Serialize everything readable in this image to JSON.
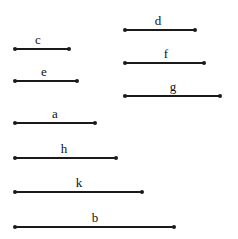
{
  "figure": {
    "type": "line-segment-length-diagram",
    "width": 238,
    "height": 239,
    "background_color": "#ffffff",
    "line_color": "#1a1a1a",
    "label_color": "#111111",
    "endpoint_marker": "filled-dot"
  },
  "chart_data": {
    "type": "bar",
    "title": "",
    "xlabel": "",
    "ylabel": "",
    "orientation": "horizontal",
    "categories": [
      "c",
      "d",
      "e",
      "f",
      "g",
      "a",
      "h",
      "k",
      "b"
    ],
    "values": [
      56,
      72,
      64,
      81,
      97,
      82,
      103,
      129,
      161
    ],
    "note": "Each value is the pixel length of the labeled horizontal segment"
  },
  "segments": [
    {
      "id": "segment-d",
      "label": "d",
      "x1": 124,
      "x2": 196,
      "y": 29,
      "length": 72,
      "label_x": 158,
      "label_y": 14
    },
    {
      "id": "segment-c",
      "label": "c",
      "x1": 14,
      "x2": 70,
      "y": 48,
      "length": 56,
      "label_x": 38,
      "label_y": 33
    },
    {
      "id": "segment-f",
      "label": "f",
      "x1": 124,
      "x2": 205,
      "y": 62,
      "length": 81,
      "label_x": 166,
      "label_y": 47
    },
    {
      "id": "segment-e",
      "label": "e",
      "x1": 14,
      "x2": 78,
      "y": 80,
      "length": 64,
      "label_x": 44,
      "label_y": 65
    },
    {
      "id": "segment-g",
      "label": "g",
      "x1": 124,
      "x2": 221,
      "y": 95,
      "length": 97,
      "label_x": 173,
      "label_y": 80
    },
    {
      "id": "segment-a",
      "label": "a",
      "x1": 14,
      "x2": 96,
      "y": 122,
      "length": 82,
      "label_x": 55,
      "label_y": 107
    },
    {
      "id": "segment-h",
      "label": "h",
      "x1": 14,
      "x2": 117,
      "y": 157,
      "length": 103,
      "label_x": 64,
      "label_y": 142
    },
    {
      "id": "segment-k",
      "label": "k",
      "x1": 14,
      "x2": 143,
      "y": 191,
      "length": 129,
      "label_x": 79,
      "label_y": 176
    },
    {
      "id": "segment-b",
      "label": "b",
      "x1": 14,
      "x2": 175,
      "y": 226,
      "length": 161,
      "label_x": 95,
      "label_y": 211
    }
  ]
}
